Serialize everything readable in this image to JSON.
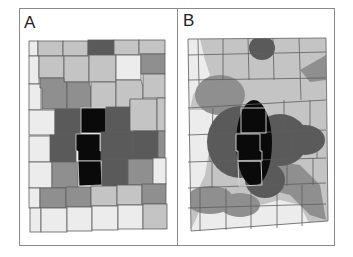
{
  "figure": {
    "panels": [
      {
        "label": "A",
        "description": "Choropleth grid of county-like cells, shaded by value",
        "legend_levels": {
          "lightest": "#ececec",
          "light": "#c4c4c4",
          "mid": "#8f8f8f",
          "dark": "#5a5a5a",
          "black": "#0a0a0a"
        }
      },
      {
        "label": "B",
        "description": "Smoothed density surface overlaid on the same grid",
        "legend_levels": {
          "lightest": "#ececec",
          "light": "#c4c4c4",
          "mid": "#8f8f8f",
          "dark": "#5a5a5a",
          "black": "#0a0a0a"
        }
      }
    ],
    "colors": {
      "frame": "#8a8a8a",
      "grid_line": "#5e5e5e",
      "highlight_outline": "#d8d8d8",
      "lightest": "#ececec",
      "light": "#c4c4c4",
      "mid": "#8f8f8f",
      "dark": "#5a5a5a",
      "black": "#0a0a0a"
    }
  }
}
